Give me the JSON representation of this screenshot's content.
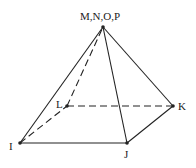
{
  "diagram": {
    "type": "square-pyramid",
    "apex": {
      "label": "M,N,O,P",
      "x": 103,
      "y": 27
    },
    "base_vertices": [
      {
        "label": "I",
        "x": 20,
        "y": 143
      },
      {
        "label": "J",
        "x": 127,
        "y": 143
      },
      {
        "label": "K",
        "x": 173,
        "y": 106
      },
      {
        "label": "L",
        "x": 67,
        "y": 106
      }
    ],
    "solid_edges": [
      "IJ",
      "JK",
      "I-apex",
      "J-apex",
      "K-apex"
    ],
    "dashed_edges": [
      "LK",
      "IL",
      "L-apex"
    ],
    "stroke_color": "#222222"
  }
}
